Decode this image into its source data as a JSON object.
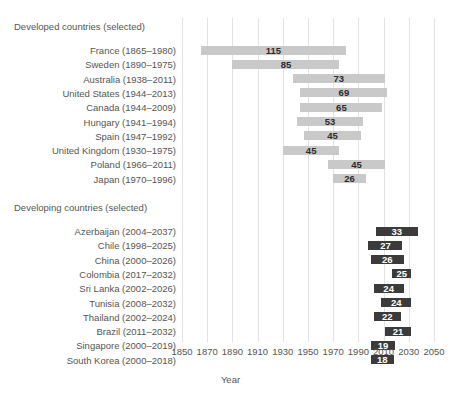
{
  "chart_data": {
    "type": "bar",
    "subtype": "horizontal-range-gantt",
    "title": "",
    "xlabel": "Year",
    "ylabel": "",
    "xlim": [
      1850,
      2050
    ],
    "xticks": [
      1850,
      1870,
      1890,
      1910,
      1930,
      1950,
      1970,
      1990,
      2010,
      2030,
      2050
    ],
    "xtick_labels": [
      "1850",
      "1870",
      "1890",
      "1910",
      "1930",
      "1950",
      "1970",
      "1990",
      "2010",
      "2030",
      "2050"
    ],
    "grid": "vertical",
    "legend": "none",
    "value_label_note": "Bar label is the duration in years (end - start).",
    "groups": [
      {
        "name": "developed",
        "heading": "Developed countries (selected)",
        "bar_color": "#c9c9c9",
        "label_color": "#2b2b2b",
        "rows": [
          {
            "label": "France (1865–1980)",
            "country": "France",
            "start": 1865,
            "end": 1980,
            "value": 115
          },
          {
            "label": "Sweden (1890–1975)",
            "country": "Sweden",
            "start": 1890,
            "end": 1975,
            "value": 85
          },
          {
            "label": "Australia (1938–2011)",
            "country": "Australia",
            "start": 1938,
            "end": 2011,
            "value": 73
          },
          {
            "label": "United States (1944–2013)",
            "country": "United States",
            "start": 1944,
            "end": 2013,
            "value": 69
          },
          {
            "label": "Canada (1944–2009)",
            "country": "Canada",
            "start": 1944,
            "end": 2009,
            "value": 65
          },
          {
            "label": "Hungary (1941–1994)",
            "country": "Hungary",
            "start": 1941,
            "end": 1994,
            "value": 53
          },
          {
            "label": "Spain (1947–1992)",
            "country": "Spain",
            "start": 1947,
            "end": 1992,
            "value": 45
          },
          {
            "label": "United Kingdom (1930–1975)",
            "country": "United Kingdom",
            "start": 1930,
            "end": 1975,
            "value": 45
          },
          {
            "label": "Poland (1966–2011)",
            "country": "Poland",
            "start": 1966,
            "end": 2011,
            "value": 45
          },
          {
            "label": "Japan (1970–1996)",
            "country": "Japan",
            "start": 1970,
            "end": 1996,
            "value": 26
          }
        ]
      },
      {
        "name": "developing",
        "heading": "Developing countries (selected)",
        "bar_color": "#3b3b3b",
        "label_color": "#ffffff",
        "rows": [
          {
            "label": "Azerbaijan (2004–2037)",
            "country": "Azerbaijan",
            "start": 2004,
            "end": 2037,
            "value": 33
          },
          {
            "label": "Chile (1998–2025)",
            "country": "Chile",
            "start": 1998,
            "end": 2025,
            "value": 27
          },
          {
            "label": "China (2000–2026)",
            "country": "China",
            "start": 2000,
            "end": 2026,
            "value": 26
          },
          {
            "label": "Colombia (2017–2032)",
            "country": "Colombia",
            "start": 2017,
            "end": 2032,
            "value": 25
          },
          {
            "label": "Sri Lanka (2002–2026)",
            "country": "Sri Lanka",
            "start": 2002,
            "end": 2026,
            "value": 24
          },
          {
            "label": "Tunisia (2008–2032)",
            "country": "Tunisia",
            "start": 2008,
            "end": 2032,
            "value": 24
          },
          {
            "label": "Thailand (2002–2024)",
            "country": "Thailand",
            "start": 2002,
            "end": 2024,
            "value": 22
          },
          {
            "label": "Brazil (2011–2032)",
            "country": "Brazil",
            "start": 2011,
            "end": 2032,
            "value": 21
          },
          {
            "label": "Singapore (2000–2019)",
            "country": "Singapore",
            "start": 2000,
            "end": 2019,
            "value": 19
          },
          {
            "label": "South Korea (2000–2018)",
            "country": "South Korea",
            "start": 2000,
            "end": 2018,
            "value": 18
          }
        ]
      }
    ]
  },
  "colors": {
    "developed_bar": "#c9c9c9",
    "developing_bar": "#3b3b3b",
    "gridline": "#e2e2e2",
    "text": "#555555",
    "background": "#ffffff"
  }
}
